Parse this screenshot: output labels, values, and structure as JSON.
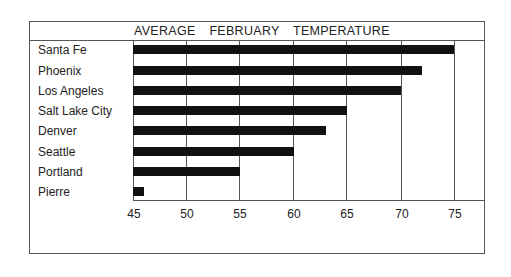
{
  "chart_data": {
    "type": "bar",
    "orientation": "horizontal",
    "title": "AVERAGE FEBRUARY TEMPERATURE",
    "xlabel": "",
    "ylabel": "",
    "categories": [
      "Santa Fe",
      "Phoenix",
      "Los Angeles",
      "Salt Lake City",
      "Denver",
      "Seattle",
      "Portland",
      "Pierre"
    ],
    "values": [
      75,
      72,
      70,
      65,
      63,
      60,
      55,
      46
    ],
    "xlim": [
      45,
      75
    ],
    "xticks": [
      "45",
      "50",
      "55",
      "60",
      "65",
      "70",
      "75"
    ],
    "grid": true,
    "legend": null
  }
}
